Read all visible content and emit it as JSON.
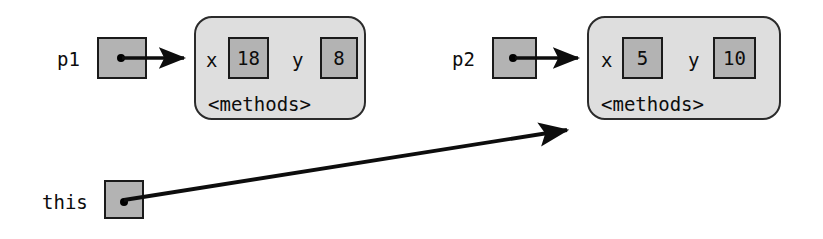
{
  "diagram": {
    "type": "object-reference-diagram",
    "colors": {
      "background": "#ffffff",
      "box_fill": "#b3b3b3",
      "panel_fill": "#dedede",
      "stroke": "#1a1a1a",
      "text": "#0d0d0d"
    },
    "variables": [
      {
        "name": "p1",
        "label": "p1",
        "points_to": "object-1"
      },
      {
        "name": "p2",
        "label": "p2",
        "points_to": "object-2"
      },
      {
        "name": "this",
        "label": "this",
        "points_to": "object-2"
      }
    ],
    "objects": [
      {
        "id": "object-1",
        "fields": [
          {
            "name": "x",
            "value": "18"
          },
          {
            "name": "y",
            "value": "8"
          }
        ],
        "methods_label": "<methods>"
      },
      {
        "id": "object-2",
        "fields": [
          {
            "name": "x",
            "value": "5"
          },
          {
            "name": "y",
            "value": "10"
          }
        ],
        "methods_label": "<methods>"
      }
    ],
    "arrows": [
      {
        "from": "p1",
        "to": "object-1"
      },
      {
        "from": "p2",
        "to": "object-2"
      },
      {
        "from": "this",
        "to": "object-2"
      }
    ]
  }
}
